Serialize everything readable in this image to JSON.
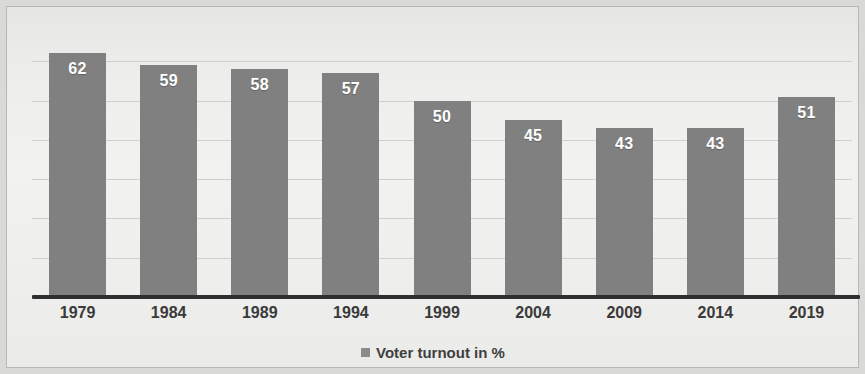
{
  "chart_data": {
    "type": "bar",
    "title": "",
    "subtitle": "",
    "xlabel": "",
    "ylabel": "",
    "categories": [
      "1979",
      "1984",
      "1989",
      "1994",
      "1999",
      "2004",
      "2009",
      "2014",
      "2019"
    ],
    "values": [
      62,
      59,
      58,
      57,
      50,
      45,
      43,
      43,
      51
    ],
    "series": [
      {
        "name": "Voter turnout in %",
        "values": [
          62,
          59,
          58,
          57,
          50,
          45,
          43,
          43,
          51
        ]
      }
    ],
    "ylim": [
      0,
      70
    ],
    "gridlines": [
      10,
      20,
      30,
      40,
      50,
      60
    ],
    "grid": true,
    "legend_position": "bottom",
    "data_labels": [
      "62",
      "59",
      "58",
      "57",
      "50",
      "45",
      "43",
      "43",
      "51"
    ],
    "bar_color": "#808080",
    "data_label_color": "#ffffff",
    "axis_color": "#2f2f2f",
    "grid_color": "#cfcfcd",
    "background_color": "#f0f0ee"
  },
  "legend": {
    "marker": "square-swatch-icon",
    "label": "Voter turnout in %"
  }
}
